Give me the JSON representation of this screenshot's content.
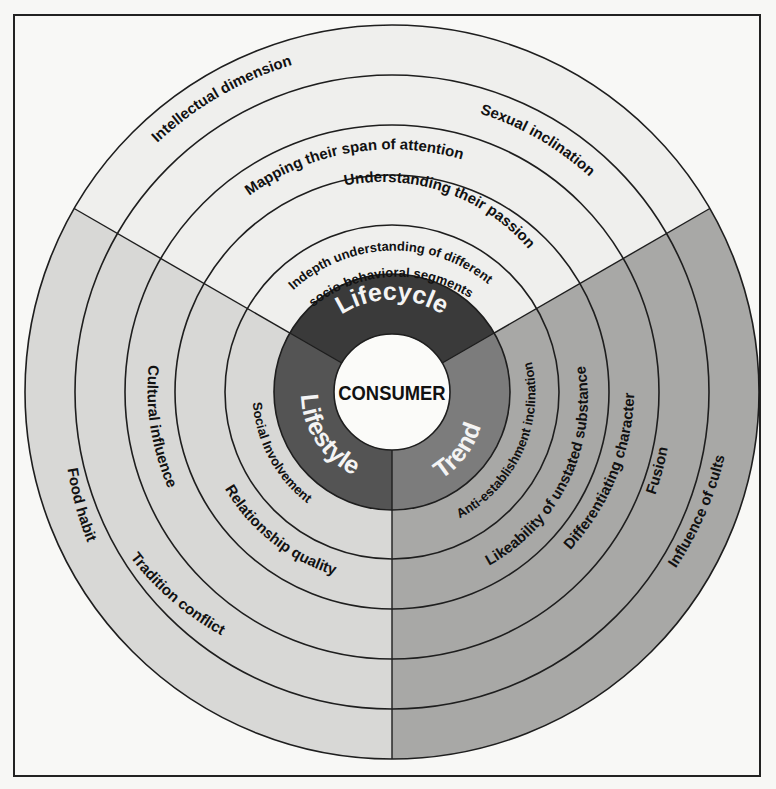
{
  "diagram": {
    "center_label": "CONSUMER",
    "colors": {
      "top_sector": "#efefed",
      "left_sector": "#d8d8d6",
      "right_sector": "#a8a8a6",
      "lifecycle_core": "#3a3a3a",
      "lifestyle_core": "#545454",
      "trend_core": "#7c7c7c",
      "center_fill": "#fbfbf9",
      "stroke": "#1e1e1e"
    },
    "core_segments": {
      "lifecycle": "Lifecycle",
      "lifestyle": "Lifestyle",
      "trend": "Trend"
    },
    "lifecycle_rings": {
      "ring1_line1": "Indepth understanding of different",
      "ring1_line2": "socio-behavioral segments",
      "ring2": "Understanding their passion",
      "ring3": "Mapping their span of attention",
      "ring4": "Sexual inclination",
      "ring5": "Intellectual dimension"
    },
    "lifestyle_rings": {
      "ring1": "Social Involvement",
      "ring2": "Relationship quality",
      "ring3": "Cultural influence",
      "ring4": "Tradition conflict",
      "ring5": "Food habit"
    },
    "trend_rings": {
      "ring1": "Anti-establishment inclination",
      "ring2": "Likeability of unstated substance",
      "ring3": "Differentiating character",
      "ring4": "Fusion",
      "ring5": "Influence of cults"
    }
  }
}
